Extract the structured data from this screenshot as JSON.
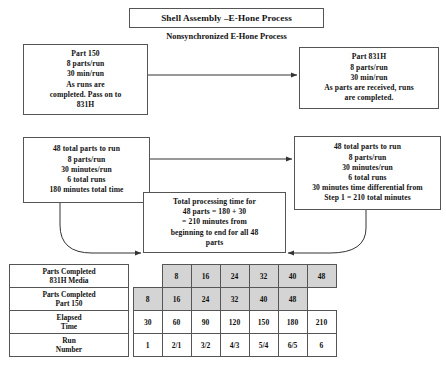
{
  "title": "Shell Assembly –E-Hone Process",
  "subtitle": "Nonsynchronized E-Hone Process",
  "boxes": {
    "part150": [
      "Part 150",
      "8 parts/run",
      "30 min/run",
      "As runs are",
      "completed. Pass on to",
      "831H"
    ],
    "part831h": [
      "Part 831H",
      "8 parts/run",
      "30 min/run",
      "As parts are received, runs",
      "are completed."
    ],
    "step1": [
      "48 total parts to run",
      "8 parts/run",
      "30 minutes/run",
      "6 total runs",
      "180 minutes total time"
    ],
    "step2": [
      "48 total parts to run",
      "8 parts/run",
      "30 minutes/run",
      "6 total runs",
      "30 minutes time differential from",
      "Step 1 = 210 total minutes"
    ],
    "total": [
      "Total processing time for",
      "48 parts = 180 + 30",
      "= 210 minutes from",
      "beginning to end for all 48",
      "parts"
    ]
  },
  "table": {
    "row_labels": [
      "Parts Completed\n831H Media",
      "Parts Completed\nPart 150",
      "Elapsed\nTime",
      "Run\nNumber"
    ],
    "rows": [
      {
        "name": "parts-completed-831h-media",
        "shaded": true,
        "offset": 1,
        "cells": [
          "8",
          "16",
          "24",
          "32",
          "40",
          "48"
        ]
      },
      {
        "name": "parts-completed-part-150",
        "shaded": true,
        "offset": 0,
        "cells": [
          "8",
          "16",
          "24",
          "32",
          "40",
          "48"
        ]
      },
      {
        "name": "elapsed-time",
        "shaded": false,
        "offset": 0,
        "cells": [
          "30",
          "60",
          "90",
          "120",
          "150",
          "180",
          "210"
        ]
      },
      {
        "name": "run-number",
        "shaded": false,
        "offset": 0,
        "cells": [
          "1",
          "2/1",
          "3/2",
          "4/3",
          "5/4",
          "6/5",
          "6"
        ]
      }
    ],
    "columns": 7
  },
  "colors": {
    "border": "#555555",
    "shade": "#d4d4d4",
    "background": "#ffffff",
    "text": "#111111"
  }
}
